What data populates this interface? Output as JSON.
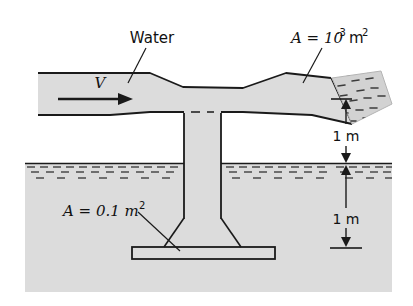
{
  "figure": {
    "kind": "engineering-diagram",
    "background_color": "#ffffff",
    "fill_color": "#dcdcdc",
    "line_color": "#1a1a1a",
    "labels": {
      "water": "Water",
      "velocity": "V",
      "nozzle_area_prefix": "A = 10",
      "nozzle_area_exponent": "-3",
      "nozzle_area_unit": "m",
      "nozzle_area_unit_exponent": "2",
      "pipe_area_prefix": "A = 0.1 m",
      "pipe_area_unit_exponent": "2",
      "dimension_upper": "1 m",
      "dimension_lower": "1 m"
    },
    "dimensions": [
      {
        "name": "nozzle-to-ground",
        "value": "1 m"
      },
      {
        "name": "ground-to-baseplate",
        "value": "1 m"
      }
    ],
    "annotations": [
      {
        "name": "water-label",
        "text": "Water",
        "leader": true
      },
      {
        "name": "velocity-arrow-label",
        "text": "V",
        "leader": false
      },
      {
        "name": "nozzle-area-label",
        "text": "A = 10-3m2",
        "leader": true
      },
      {
        "name": "suction-pipe-area-label",
        "text": "A = 0.1 m2",
        "leader": true
      }
    ]
  }
}
